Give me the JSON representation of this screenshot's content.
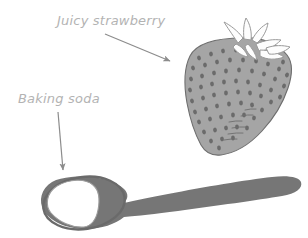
{
  "illustration": {
    "title": "Baking soda and strawberry labeled illustration",
    "background_color": "#ffffff",
    "width": 308,
    "height": 238
  },
  "labels": [
    {
      "id": "strawberry",
      "text": "Juicy strawberry",
      "color": "#b3b3b3",
      "x": 57,
      "y": 25
    },
    {
      "id": "baking-soda",
      "text": "Baking soda",
      "color": "#b3b3b3",
      "x": 18,
      "y": 103
    }
  ],
  "arrows": [
    {
      "id": "arrow-to-strawberry",
      "from_label": "Juicy strawberry",
      "points_to": "strawberry",
      "color": "#8c8c8c",
      "start_x": 105,
      "start_y": 34,
      "end_x": 172,
      "end_y": 62
    },
    {
      "id": "arrow-to-baking-soda",
      "from_label": "Baking soda",
      "points_to": "baking-soda-mound",
      "color": "#8c8c8c",
      "start_x": 58,
      "start_y": 112,
      "end_x": 64,
      "end_y": 173
    }
  ],
  "objects": [
    {
      "id": "strawberry",
      "name": "strawberry",
      "body_color": "#a5a5a5",
      "outline_color": "#6e6e6e",
      "seed_color": "#6b6b6b",
      "calyx_color": "#fdfdfd",
      "calyx_outline_color": "#9a9a9a",
      "seed_count": 118
    },
    {
      "id": "spoon",
      "name": "spoon",
      "body_color": "#767676",
      "outline_color": "#6a6a6a",
      "powder_color": "#ffffff",
      "powder_outline_color": "#9c9c9c",
      "powder_label": "baking soda"
    }
  ],
  "colors": {
    "label_gray": "#b3b3b3",
    "arrow_gray": "#8c8c8c",
    "strawberry_fill": "#a5a5a5",
    "strawberry_seed": "#6b6b6b",
    "spoon_fill": "#767676",
    "powder_white": "#ffffff",
    "background": "#ffffff"
  }
}
